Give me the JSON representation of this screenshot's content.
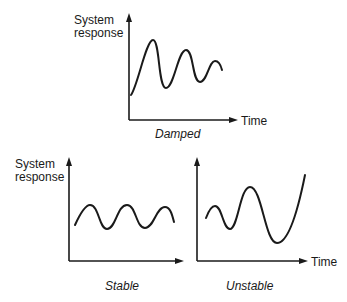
{
  "diagram": {
    "panels": [
      {
        "id": "damped",
        "y_label_line1": "System",
        "y_label_line2": "response",
        "x_label": "Time",
        "caption": "Damped",
        "behavior": "oscillation decreasing in amplitude over time"
      },
      {
        "id": "stable",
        "y_label_line1": "System",
        "y_label_line2": "response",
        "x_label": "",
        "caption": "Stable",
        "behavior": "oscillation with constant amplitude"
      },
      {
        "id": "unstable",
        "y_label_line1": "",
        "y_label_line2": "",
        "x_label": "Time",
        "caption": "Unstable",
        "behavior": "oscillation growing in amplitude over time"
      }
    ]
  }
}
